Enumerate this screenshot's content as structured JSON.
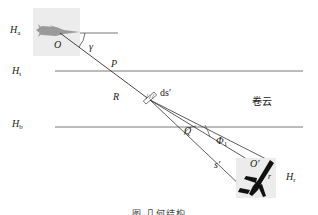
{
  "diagram": {
    "layers": {
      "Ha": {
        "symbol": "H",
        "sub": "a"
      },
      "Ht": {
        "symbol": "H",
        "sub": "t"
      },
      "Hb": {
        "symbol": "H",
        "sub": "b"
      },
      "Hr": {
        "symbol": "H",
        "sub": "r"
      }
    },
    "points": {
      "O": "O",
      "P": "P",
      "R": "R",
      "Q": "Q",
      "O_prime": "O′",
      "r": "r"
    },
    "angles": {
      "gamma": "γ",
      "phi": "Φ",
      "phi_sub": "1"
    },
    "elements": {
      "ds_prime": "ds′",
      "s_prime": "s′"
    },
    "region_label": "卷云",
    "caption": "图      几何结构"
  }
}
